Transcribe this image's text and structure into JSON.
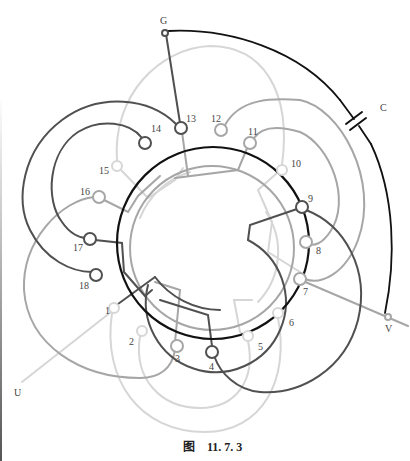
{
  "figure": {
    "caption_prefix": "图",
    "caption_number": "11. 7. 3"
  },
  "terminals": {
    "G": "G",
    "C": "C",
    "U": "U",
    "V": "V"
  },
  "slots": [
    "1",
    "2",
    "3",
    "4",
    "5",
    "6",
    "7",
    "8",
    "9",
    "10",
    "11",
    "12",
    "13",
    "14",
    "15",
    "16",
    "17",
    "18"
  ],
  "colors": {
    "black": "#111111",
    "dark": "#505050",
    "mid": "#a6a6a6",
    "light": "#d6d6d6"
  }
}
